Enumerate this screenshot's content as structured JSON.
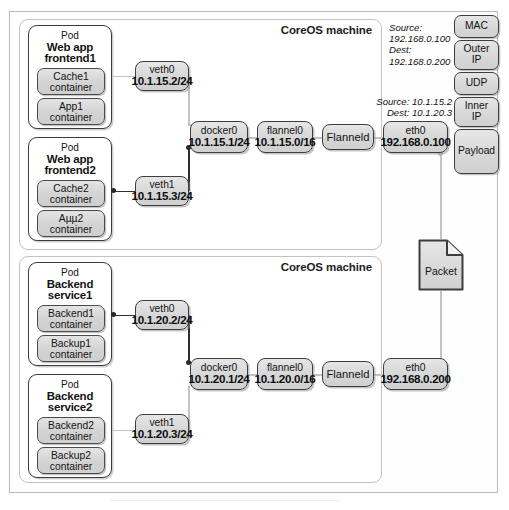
{
  "diagram": {
    "host_label": "CoreOS machine",
    "packet_label": "Packet"
  },
  "hosts": [
    {
      "id": "host-top",
      "label": "CoreOS machine",
      "pods": [
        {
          "id": "pod-frontend1",
          "kind": "Pod",
          "name_line1": "Web app",
          "name_line2": "frontend1",
          "containers": [
            {
              "name": "Cache1",
              "kind": "container"
            },
            {
              "name": "App1",
              "kind": "container"
            }
          ]
        },
        {
          "id": "pod-frontend2",
          "kind": "Pod",
          "name_line1": "Web app",
          "name_line2": "frontend2",
          "containers": [
            {
              "name": "Cache2",
              "kind": "container"
            },
            {
              "name": "Aµµ2",
              "kind": "container"
            }
          ]
        }
      ],
      "network": [
        {
          "id": "veth0-top",
          "name": "veth0",
          "addr": "10.1.15.2/24"
        },
        {
          "id": "veth1-top",
          "name": "veth1",
          "addr": "10.1.15.3/24"
        },
        {
          "id": "docker0-top",
          "name": "docker0",
          "addr": "10.1.15.1/24"
        },
        {
          "id": "flannel0-top",
          "name": "flannel0",
          "addr": "10.1.15.0/16"
        },
        {
          "id": "flanneld-top",
          "name": "Flanneld",
          "addr": ""
        },
        {
          "id": "eth0-top",
          "name": "eth0",
          "addr": "192.168.0.100"
        }
      ]
    },
    {
      "id": "host-bottom",
      "label": "CoreOS machine",
      "pods": [
        {
          "id": "pod-backend1",
          "kind": "Pod",
          "name_line1": "Backend",
          "name_line2": "service1",
          "containers": [
            {
              "name": "Backend1",
              "kind": "container"
            },
            {
              "name": "Backup1",
              "kind": "container"
            }
          ]
        },
        {
          "id": "pod-backend2",
          "kind": "Pod",
          "name_line1": "Backend",
          "name_line2": "service2",
          "containers": [
            {
              "name": "Backend2",
              "kind": "container"
            },
            {
              "name": "Backup2",
              "kind": "container"
            }
          ]
        }
      ],
      "network": [
        {
          "id": "veth0-bot",
          "name": "veth0",
          "addr": "10.1.20.2/24"
        },
        {
          "id": "veth1-bot",
          "name": "veth1",
          "addr": "10.1.20.3/24"
        },
        {
          "id": "docker0-bot",
          "name": "docker0",
          "addr": "10.1.20.1/24"
        },
        {
          "id": "flannel0-bot",
          "name": "flannel0",
          "addr": "10.1.20.0/16"
        },
        {
          "id": "flanneld-bot",
          "name": "Flanneld",
          "addr": ""
        },
        {
          "id": "eth0-bot",
          "name": "eth0",
          "addr": "192.168.0.200"
        }
      ]
    }
  ],
  "packet_stack": {
    "layers": [
      {
        "id": "mac",
        "label": "MAC"
      },
      {
        "id": "outer-ip",
        "label": "Outer\nIP"
      },
      {
        "id": "udp",
        "label": "UDP"
      },
      {
        "id": "inner-ip",
        "label": "Inner\nIP"
      },
      {
        "id": "payload",
        "label": "Payload"
      }
    ],
    "annotations": [
      {
        "id": "outer-ip-annotation",
        "target": "outer-ip",
        "lines": [
          "Source:",
          "192.168.0.100",
          "Dest:",
          "192.168.0.200"
        ]
      },
      {
        "id": "inner-ip-annotation",
        "target": "inner-ip",
        "lines": [
          "Source: 10.1.15.2",
          "Dest: 10.1.20.3"
        ]
      }
    ]
  },
  "colors": {
    "frame_border": "#b9b9b9",
    "host_border": "#c2c2c2",
    "node_border": "#3d3d3d",
    "node_fill": "#d8d8d8",
    "wire_light": "#c3c3c3",
    "wire_dark": "#2e2e2e",
    "text": "#141414",
    "background": "#ffffff"
  }
}
